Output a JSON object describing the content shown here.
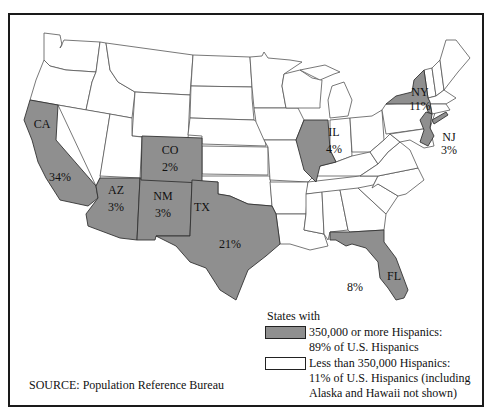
{
  "map": {
    "fill_colors": {
      "high": "#8f8f8f",
      "low": "#ffffff"
    },
    "highlighted_states": [
      {
        "code": "CA",
        "share": "34%"
      },
      {
        "code": "TX",
        "share": "21%"
      },
      {
        "code": "NY",
        "share": "11%"
      },
      {
        "code": "FL",
        "share": "8%"
      },
      {
        "code": "IL",
        "share": "4%"
      },
      {
        "code": "AZ",
        "share": "3%"
      },
      {
        "code": "NM",
        "share": "3%"
      },
      {
        "code": "NJ",
        "share": "3%"
      },
      {
        "code": "CO",
        "share": "2%"
      }
    ]
  },
  "labels": {
    "ca": {
      "code": "CA",
      "pct": "34%"
    },
    "co": {
      "code": "CO",
      "pct": "2%"
    },
    "az": {
      "code": "AZ",
      "pct": "3%"
    },
    "nm": {
      "code": "NM",
      "pct": "3%"
    },
    "tx": {
      "code": "TX",
      "pct": "21%"
    },
    "il": {
      "code": "IL",
      "pct": "4%"
    },
    "ny": {
      "code": "NY",
      "pct": "11%"
    },
    "nj": {
      "code": "NJ",
      "pct": "3%"
    },
    "fl": {
      "code": "FL",
      "pct": "8%"
    }
  },
  "legend": {
    "title": "States with",
    "items": [
      {
        "label": "350,000 or more Hispanics:\n89% of U.S. Hispanics",
        "color": "#8f8f8f"
      },
      {
        "label": "Less than 350,000 Hispanics:\n11% of U.S. Hispanics (including\nAlaska and Hawaii not shown)",
        "color": "#ffffff"
      }
    ]
  },
  "source": "SOURCE: Population Reference Bureau"
}
